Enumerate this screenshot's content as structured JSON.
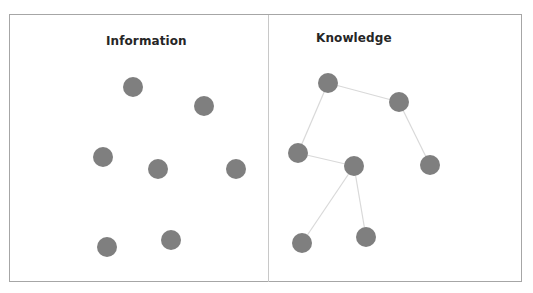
{
  "colors": {
    "node_fill": "#7f7f7f",
    "edge_stroke": "#d9d9d9",
    "frame_border": "#a6a6a6",
    "divider": "#c8c8c8",
    "title_text": "#262626"
  },
  "panels": {
    "information": {
      "title": "Information",
      "nodes": [
        {
          "id": "i1",
          "x": 133,
          "y": 87
        },
        {
          "id": "i2",
          "x": 204,
          "y": 106
        },
        {
          "id": "i3",
          "x": 103,
          "y": 157
        },
        {
          "id": "i4",
          "x": 158,
          "y": 169
        },
        {
          "id": "i5",
          "x": 236,
          "y": 169
        },
        {
          "id": "i6",
          "x": 107,
          "y": 247
        },
        {
          "id": "i7",
          "x": 171,
          "y": 240
        }
      ],
      "edges": []
    },
    "knowledge": {
      "title": "Knowledge",
      "nodes": [
        {
          "id": "k1",
          "x": 328,
          "y": 83
        },
        {
          "id": "k2",
          "x": 399,
          "y": 102
        },
        {
          "id": "k3",
          "x": 298,
          "y": 153
        },
        {
          "id": "k4",
          "x": 354,
          "y": 166
        },
        {
          "id": "k5",
          "x": 430,
          "y": 165
        },
        {
          "id": "k6",
          "x": 302,
          "y": 243
        },
        {
          "id": "k7",
          "x": 366,
          "y": 237
        }
      ],
      "edges": [
        [
          "k1",
          "k2"
        ],
        [
          "k1",
          "k3"
        ],
        [
          "k2",
          "k5"
        ],
        [
          "k3",
          "k4"
        ],
        [
          "k4",
          "k6"
        ],
        [
          "k4",
          "k7"
        ]
      ]
    }
  },
  "node_radius": 10
}
